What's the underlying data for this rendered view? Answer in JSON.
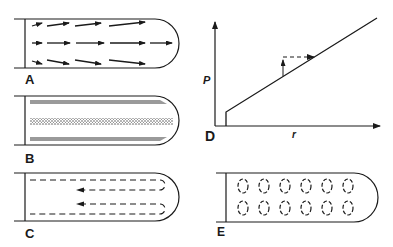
{
  "figure": {
    "panels": [
      {
        "id": "A",
        "label": "A",
        "description": "velocity-vector-field"
      },
      {
        "id": "B",
        "label": "B",
        "description": "particle-banding"
      },
      {
        "id": "C",
        "label": "C",
        "description": "recirculating-flow"
      },
      {
        "id": "D",
        "label": "D",
        "description": "pressure-vs-radius-plot"
      },
      {
        "id": "E",
        "label": "E",
        "description": "vortex-cells"
      }
    ],
    "graph_d": {
      "y_axis_label": "P",
      "x_axis_label": "r"
    },
    "colors": {
      "ink": "#1a1a1a",
      "band_grey": "#9a9a9a",
      "background": "#ffffff"
    }
  }
}
